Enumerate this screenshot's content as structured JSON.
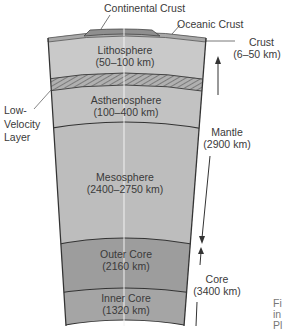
{
  "diagram": {
    "type": "earth-interior-cross-section",
    "colors": {
      "crust_continental": "#8f8f8f",
      "crust_oceanic": "#a9a9a9",
      "lithosphere": "#c9c9c9",
      "low_velocity_hatch": "#9a9a9a",
      "asthenosphere": "#c2c2c2",
      "mesosphere": "#bdbdbd",
      "outer_core": "#9d9d9d",
      "inner_core": "#a5a5a5",
      "outline": "#333333"
    },
    "top_labels": {
      "continental_crust": "Continental Crust",
      "oceanic_crust": "Oceanic Crust"
    },
    "layers": [
      {
        "name": "Lithosphere",
        "thickness": "(50–100 km)"
      },
      {
        "name": "Asthenosphere",
        "thickness": "(100–400 km)"
      },
      {
        "name": "Mesosphere",
        "thickness": "(2400–2750 km)"
      },
      {
        "name": "Outer Core",
        "thickness": "(2160 km)"
      },
      {
        "name": "Inner Core",
        "thickness": "(1320 km)"
      }
    ],
    "left_labels": {
      "low_velocity_line1": "Low-",
      "low_velocity_line2": "Velocity",
      "low_velocity_line3": "Layer"
    },
    "right_labels": {
      "crust_name": "Crust",
      "crust_range": "(6–50 km)",
      "mantle_name": "Mantle",
      "mantle_range": "(2900 km)",
      "core_name": "Core",
      "core_range": "(3400 km)"
    },
    "caption_fragment": {
      "line1": "Fi",
      "line2": "in",
      "line3": "Pl"
    }
  }
}
